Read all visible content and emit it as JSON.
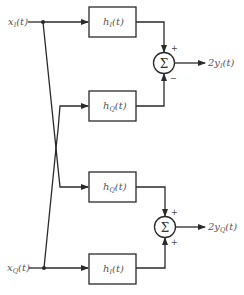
{
  "diagram": {
    "inputs": [
      {
        "id": "xI",
        "base": "x",
        "sub": "I",
        "arg": "(t)"
      },
      {
        "id": "xQ",
        "base": "x",
        "sub": "Q",
        "arg": "(t)"
      }
    ],
    "blocks": [
      {
        "id": "b1",
        "base": "h",
        "sub": "I",
        "arg": "(t)"
      },
      {
        "id": "b2",
        "base": "h",
        "sub": "Q",
        "arg": "(t)"
      },
      {
        "id": "b3",
        "base": "h",
        "sub": "Q",
        "arg": "(t)"
      },
      {
        "id": "b4",
        "base": "h",
        "sub": "I",
        "arg": "(t)"
      }
    ],
    "summers": [
      {
        "id": "s1",
        "symbol": "Σ",
        "top_sign": "+",
        "bottom_sign": "−"
      },
      {
        "id": "s2",
        "symbol": "Σ",
        "top_sign": "+",
        "bottom_sign": "+"
      }
    ],
    "outputs": [
      {
        "id": "yI",
        "base": "2y",
        "sub": "I",
        "arg": "(t)"
      },
      {
        "id": "yQ",
        "base": "2y",
        "sub": "Q",
        "arg": "(t)"
      }
    ]
  }
}
